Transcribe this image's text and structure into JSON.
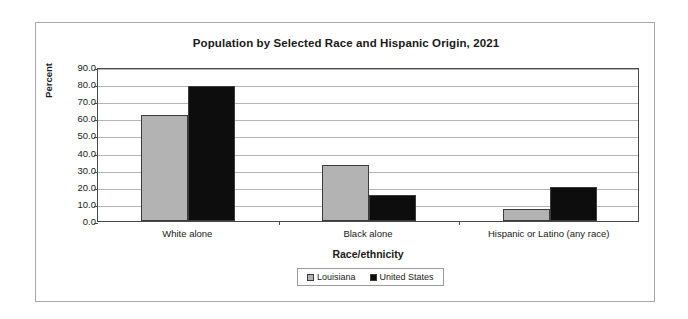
{
  "chart_data": {
    "type": "bar",
    "title": "Population by Selected Race and Hispanic Origin, 2021",
    "xlabel": "Race/ethnicity",
    "ylabel": "Percent",
    "categories": [
      "White alone",
      "Black alone",
      "Hispanic or Latino (any race)"
    ],
    "series": [
      {
        "name": "Louisiana",
        "color": "#b3b3b3",
        "values": [
          62.0,
          33.0,
          7.0
        ]
      },
      {
        "name": "United States",
        "color": "#0d0d0d",
        "values": [
          79.0,
          15.0,
          20.0
        ]
      }
    ],
    "ylim": [
      0.0,
      90.0
    ],
    "ytick_labels": [
      "90.0",
      "80.0",
      "70.0",
      "60.0",
      "50.0",
      "40.0",
      "30.0",
      "20.0",
      "10.0",
      "0.0"
    ],
    "ytick_values": [
      90.0,
      80.0,
      70.0,
      60.0,
      50.0,
      40.0,
      30.0,
      20.0,
      10.0,
      0.0
    ],
    "grid": true,
    "legend_position": "bottom-center"
  }
}
